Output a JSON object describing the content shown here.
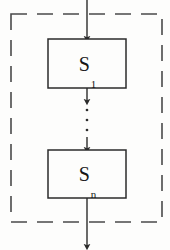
{
  "diagram": {
    "type": "flowchart",
    "colors": {
      "stroke": "#2b2b2b",
      "box_fill": "#fdfdfc",
      "dashed_border": "#4a4a4a",
      "background": "#fdfdfc",
      "text": "#151515"
    },
    "container": {
      "label": "",
      "border_style": "dashed",
      "x": 11,
      "y": 14,
      "width": 151,
      "height": 208
    },
    "nodes": [
      {
        "id": "s1",
        "label_base": "S",
        "label_sub": "1",
        "shape": "rectangle",
        "x": 48,
        "y": 39,
        "width": 78,
        "height": 49
      },
      {
        "id": "sn",
        "label_base": "S",
        "label_sub": "n",
        "shape": "rectangle",
        "x": 48,
        "y": 150,
        "width": 78,
        "height": 48
      }
    ],
    "edges": [
      {
        "id": "entry",
        "from": "outside-top",
        "to": "s1",
        "arrow": true
      },
      {
        "id": "s1-to-dots",
        "from": "s1",
        "to": "ellipsis",
        "arrow": true
      },
      {
        "id": "dots-to-sn",
        "from": "ellipsis",
        "to": "sn",
        "arrow": true
      },
      {
        "id": "exit",
        "from": "sn",
        "to": "outside-bottom",
        "arrow": true
      }
    ],
    "ellipsis": {
      "symbol": "vertical-dots",
      "count": 3,
      "x": 87,
      "points_y": [
        110,
        120,
        130
      ]
    }
  }
}
